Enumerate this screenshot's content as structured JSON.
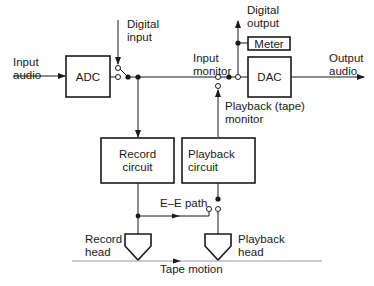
{
  "diagram": {
    "type": "block-diagram",
    "colors": {
      "line": "#1a1a1a",
      "tape": "#9a9a9a",
      "background": "#ffffff"
    },
    "blocks": {
      "adc": "ADC",
      "dac": "DAC",
      "meter": "Meter",
      "record_circuit": [
        "Record",
        "circuit"
      ],
      "playback_circuit": [
        "Playback",
        "circuit"
      ]
    },
    "labels": {
      "input_audio": [
        "Input",
        "audio"
      ],
      "digital_input": [
        "Digital",
        "input"
      ],
      "digital_output": [
        "Digital",
        "output"
      ],
      "input_monitor": [
        "Input",
        "monitor"
      ],
      "output_audio": [
        "Output",
        "audio"
      ],
      "playback_monitor": [
        "Playback (tape)",
        "monitor"
      ],
      "ee_path": "E–E path",
      "record_head": [
        "Record",
        "head"
      ],
      "playback_head": [
        "Playback",
        "head"
      ],
      "tape_motion": "Tape motion"
    },
    "connections": [
      {
        "from": "Input audio",
        "to": "ADC"
      },
      {
        "from": "ADC",
        "to": "input selector switch"
      },
      {
        "from": "Digital input",
        "to": "input selector switch"
      },
      {
        "from": "input selector switch",
        "to": "Record circuit"
      },
      {
        "from": "input selector switch",
        "to": "monitor switch (Input monitor)"
      },
      {
        "from": "Record circuit",
        "to": "Record head"
      },
      {
        "from": "Record circuit",
        "to": "E–E path switch"
      },
      {
        "from": "Playback head",
        "to": "Playback circuit"
      },
      {
        "from": "Playback circuit",
        "to": "monitor switch (Playback (tape) monitor)"
      },
      {
        "from": "monitor switch",
        "to": "DAC"
      },
      {
        "from": "monitor switch",
        "to": "Meter"
      },
      {
        "from": "monitor switch",
        "to": "Digital output"
      },
      {
        "from": "DAC",
        "to": "Output audio"
      }
    ]
  }
}
